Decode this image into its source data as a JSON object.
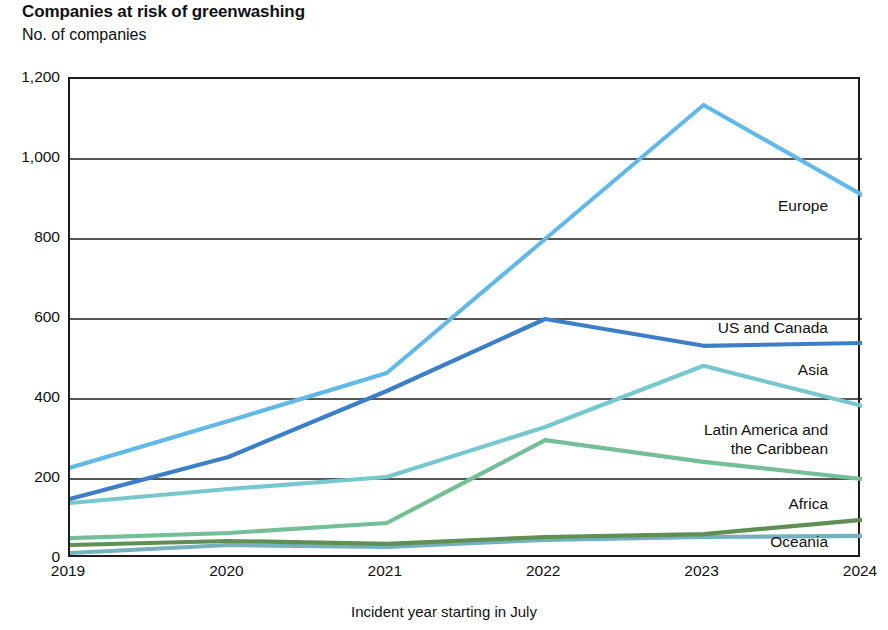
{
  "header": {
    "title": "Companies at risk of greenwashing",
    "subtitle": "No. of companies"
  },
  "axes": {
    "x_title": "Incident year starting in July",
    "y_ticks": [
      "0",
      "200",
      "400",
      "600",
      "800",
      "1,000",
      "1,200"
    ],
    "x_ticks": [
      "2019",
      "2020",
      "2021",
      "2022",
      "2023",
      "2024"
    ]
  },
  "series_labels": {
    "europe": "Europe",
    "us_and_canada": "US and Canada",
    "asia": "Asia",
    "latin_america_line1": "Latin America and",
    "latin_america_line2": "the Caribbean",
    "africa": "Africa",
    "oceania": "Oceania"
  },
  "chart_data": {
    "type": "line",
    "title": "Companies at risk of greenwashing",
    "subtitle": "No. of companies",
    "xlabel": "Incident year starting in July",
    "ylabel": "No. of companies",
    "x": [
      2019,
      2020,
      2021,
      2022,
      2023,
      2024
    ],
    "xlim": [
      2019,
      2024
    ],
    "ylim": [
      0,
      1200
    ],
    "yticks": [
      0,
      200,
      400,
      600,
      800,
      1000,
      1200
    ],
    "grid": "horizontal",
    "legend": "inline-right-labels",
    "series": [
      {
        "name": "Europe",
        "color": "#62b9e8",
        "values": [
          228,
          345,
          465,
          800,
          1135,
          910
        ]
      },
      {
        "name": "US and Canada",
        "color": "#3d7fc6",
        "values": [
          150,
          255,
          420,
          600,
          533,
          540
        ]
      },
      {
        "name": "Asia",
        "color": "#76c8ce",
        "values": [
          140,
          175,
          205,
          330,
          483,
          383
        ]
      },
      {
        "name": "Latin America and the Caribbean",
        "color": "#74bf97",
        "values": [
          52,
          65,
          90,
          297,
          243,
          200
        ]
      },
      {
        "name": "Africa",
        "color": "#5f8f52",
        "values": [
          35,
          45,
          38,
          55,
          62,
          98
        ]
      },
      {
        "name": "Oceania",
        "color": "#74b0bd",
        "values": [
          15,
          35,
          30,
          48,
          55,
          58
        ]
      }
    ]
  }
}
